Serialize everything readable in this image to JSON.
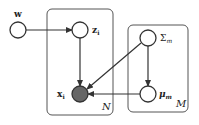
{
  "diagram": {
    "type": "probabilistic-graphical-model",
    "nodes": [
      {
        "id": "w",
        "label": "w",
        "observed": false,
        "cx": 18,
        "cy": 30
      },
      {
        "id": "z",
        "label": "z",
        "sub": "i",
        "observed": false,
        "cx": 80,
        "cy": 30
      },
      {
        "id": "sigma",
        "label": "Σ",
        "sub": "m",
        "observed": false,
        "cx": 148,
        "cy": 38
      },
      {
        "id": "x",
        "label": "x",
        "sub": "i",
        "observed": true,
        "cx": 80,
        "cy": 94
      },
      {
        "id": "mu",
        "label": "μ",
        "sub": "m",
        "observed": false,
        "cx": 148,
        "cy": 94
      }
    ],
    "edges": [
      {
        "from": "w",
        "to": "z"
      },
      {
        "from": "z",
        "to": "x"
      },
      {
        "from": "sigma",
        "to": "x"
      },
      {
        "from": "sigma",
        "to": "mu"
      },
      {
        "from": "mu",
        "to": "x"
      }
    ],
    "plates": [
      {
        "label": "N",
        "contains": [
          "z",
          "x"
        ]
      },
      {
        "label": "M",
        "contains": [
          "sigma",
          "mu"
        ]
      }
    ],
    "colors": {
      "stroke": "#333333",
      "observed_fill": "#666666",
      "plate_stroke": "#555555"
    }
  }
}
